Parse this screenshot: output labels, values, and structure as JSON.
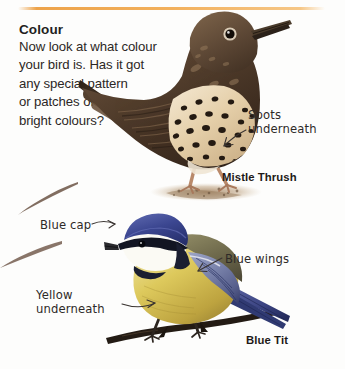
{
  "page": {
    "heading": "Colour",
    "body_lines": [
      "Now look at what colour",
      "your bird is. Has it got",
      "any special pattern",
      "or patches of",
      "bright colours?"
    ],
    "rule_color": "#f2b05c"
  },
  "callouts": {
    "spots": {
      "line1": "Spots",
      "line2": "underneath"
    },
    "blue_cap": {
      "line1": "Blue cap"
    },
    "blue_wings": {
      "line1": "Blue wings"
    },
    "yellow": {
      "line1": "Yellow",
      "line2": "underneath"
    }
  },
  "species": {
    "mistle_thrush": "Mistle Thrush",
    "blue_tit": "Blue Tit"
  },
  "colors": {
    "accent_rule": "#f2b05c",
    "thrush_body": "#5b4433",
    "thrush_breast": "#e8d4b0",
    "thrush_spot": "#2f2218",
    "tit_cap": "#3c4794",
    "tit_face": "#fdfdfa",
    "tit_belly": "#d9c34a",
    "tit_wing": "#8a93b8",
    "ground": "#b49a7e",
    "text": "#2c2725"
  }
}
